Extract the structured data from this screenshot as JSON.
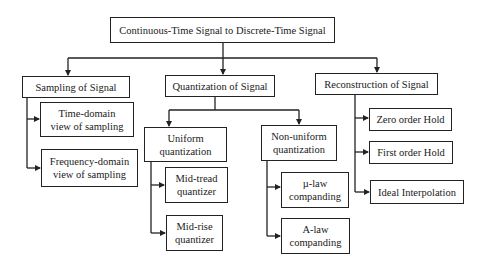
{
  "diagram": {
    "root": {
      "label": "Continuous-Time Signal to Discrete-Time Signal"
    },
    "sampling": {
      "label": "Sampling of Signal",
      "children": [
        {
          "label": "Time-domain\nview of sampling"
        },
        {
          "label": "Frequency-domain\nview of sampling"
        }
      ]
    },
    "quantization": {
      "label": "Quantization of Signal",
      "uniform": {
        "label": "Uniform\nquantization",
        "children": [
          {
            "label": "Mid-tread\nquantizer"
          },
          {
            "label": "Mid-rise\nquantizer"
          }
        ]
      },
      "nonuniform": {
        "label": "Non-uniform\nquantization",
        "children": [
          {
            "label": "µ-law\ncompanding"
          },
          {
            "label": "A-law\ncompanding"
          }
        ]
      }
    },
    "reconstruction": {
      "label": "Reconstruction of Signal",
      "children": [
        {
          "label": "Zero order Hold"
        },
        {
          "label": "First order Hold"
        },
        {
          "label": "Ideal Interpolation"
        }
      ]
    }
  },
  "colors": {
    "line": "#222222",
    "background": "#ffffff"
  }
}
